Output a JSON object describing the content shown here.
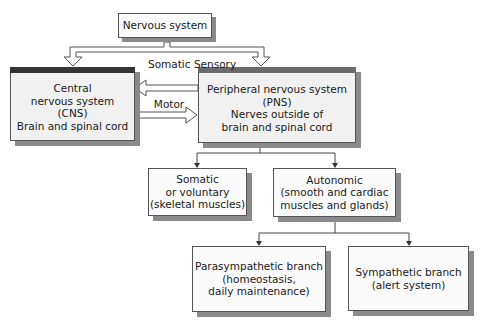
{
  "diagram": {
    "type": "hierarchy",
    "colors": {
      "cns_header": "#333333",
      "pns_header": "#6b6b6b",
      "box_fill": "#f1f1f1",
      "shadow": "#8a8a8a"
    },
    "nodes": {
      "root": {
        "lines": [
          "Nervous system"
        ]
      },
      "cns": {
        "lines": [
          "Central",
          "nervous system",
          "(CNS)",
          "Brain and spinal cord"
        ]
      },
      "pns": {
        "lines": [
          "Peripheral nervous system",
          "(PNS)",
          "Nerves outside of",
          "brain and spinal cord"
        ]
      },
      "somatic": {
        "lines": [
          "Somatic",
          "or voluntary",
          "(skeletal muscles)"
        ]
      },
      "autonomic": {
        "lines": [
          "Autonomic",
          "(smooth and cardiac",
          "muscles and glands)"
        ]
      },
      "parasympathetic": {
        "lines": [
          "Parasympathetic branch",
          "(homeostasis,",
          "daily maintenance)"
        ]
      },
      "sympathetic": {
        "lines": [
          "Sympathetic branch",
          "(alert system)"
        ]
      }
    },
    "edge_labels": {
      "sensory": [
        "Somatic",
        "Sensory"
      ],
      "motor": "Motor"
    },
    "edges": [
      {
        "from": "root",
        "to": "cns"
      },
      {
        "from": "root",
        "to": "pns"
      },
      {
        "from": "pns",
        "to": "cns",
        "label": "Somatic Sensory"
      },
      {
        "from": "cns",
        "to": "pns",
        "label": "Motor"
      },
      {
        "from": "pns",
        "to": "somatic"
      },
      {
        "from": "pns",
        "to": "autonomic"
      },
      {
        "from": "autonomic",
        "to": "parasympathetic"
      },
      {
        "from": "autonomic",
        "to": "sympathetic"
      }
    ]
  }
}
